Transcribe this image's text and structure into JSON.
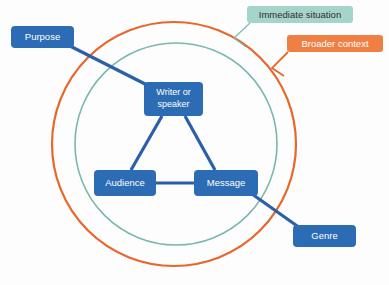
{
  "diagram": {
    "colors": {
      "node_blue": "#2b6cb4",
      "outer_ring_orange": "#e8662a",
      "inner_ring_teal": "#79b8ae",
      "context_label_teal_bg": "#a5d4cb",
      "context_label_orange_bg": "#f07f43",
      "connector_blue": "#2b5fa8",
      "background": "#fdfdfd",
      "node_text": "#ffffff",
      "teal_label_text": "#2f2f2f"
    },
    "rings": [
      {
        "id": "broader-context",
        "label": "Broader  context",
        "color": "#e8662a",
        "cx": 174,
        "cy": 144,
        "r": 122,
        "stroke_width": 2.2
      },
      {
        "id": "immediate-situation",
        "label": "Immediate situation",
        "color": "#79b8ae",
        "cx": 176,
        "cy": 144,
        "r": 101,
        "stroke_width": 1.6
      }
    ],
    "context_labels": [
      {
        "id": "immediate-situation-label",
        "text": "Immediate situation",
        "x": 247,
        "y": 6,
        "w": 106,
        "h": 17,
        "bg": "#a5d4cb",
        "text_color": "#2f2f2f",
        "leader": [
          [
            250,
            23
          ],
          [
            234,
            38
          ],
          [
            246,
            47
          ]
        ]
      },
      {
        "id": "broader-context-label",
        "text": "Broader  context",
        "x": 287,
        "y": 35,
        "w": 96,
        "h": 17,
        "bg": "#f07f43",
        "text_color": "#ffffff",
        "leader": [
          [
            288,
            52
          ],
          [
            272,
            68
          ],
          [
            284,
            76
          ]
        ]
      }
    ],
    "nodes": [
      {
        "id": "purpose",
        "label": "Purpose",
        "lines": [
          "Purpose"
        ],
        "x": 11,
        "y": 26,
        "w": 63,
        "h": 22,
        "rx": 4
      },
      {
        "id": "writer-or-speaker",
        "label": "Writer or speaker",
        "lines": [
          "Writer or",
          "speaker"
        ],
        "x": 144,
        "y": 82,
        "w": 59,
        "h": 34,
        "rx": 4
      },
      {
        "id": "audience",
        "label": "Audience",
        "lines": [
          "Audience"
        ],
        "x": 94,
        "y": 170,
        "w": 62,
        "h": 26,
        "rx": 4
      },
      {
        "id": "message",
        "label": "Message",
        "lines": [
          "Message"
        ],
        "x": 194,
        "y": 170,
        "w": 64,
        "h": 26,
        "rx": 4
      },
      {
        "id": "genre",
        "label": "Genre",
        "lines": [
          "Genre"
        ],
        "x": 293,
        "y": 225,
        "w": 63,
        "h": 22,
        "rx": 4
      }
    ],
    "connectors": [
      {
        "id": "purpose-to-writer",
        "from": "purpose",
        "to": "writer-or-speaker",
        "x1": 70,
        "y1": 46,
        "x2": 151,
        "y2": 87
      },
      {
        "id": "writer-to-audience",
        "from": "writer-or-speaker",
        "to": "audience",
        "x1": 162,
        "y1": 116,
        "x2": 131,
        "y2": 170
      },
      {
        "id": "writer-to-message",
        "from": "writer-or-speaker",
        "to": "message",
        "x1": 185,
        "y1": 116,
        "x2": 215,
        "y2": 170
      },
      {
        "id": "audience-to-message",
        "from": "audience",
        "to": "message",
        "x1": 156,
        "y1": 183,
        "x2": 194,
        "y2": 183
      },
      {
        "id": "message-to-genre",
        "from": "message",
        "to": "genre",
        "x1": 252,
        "y1": 194,
        "x2": 300,
        "y2": 228
      }
    ]
  }
}
